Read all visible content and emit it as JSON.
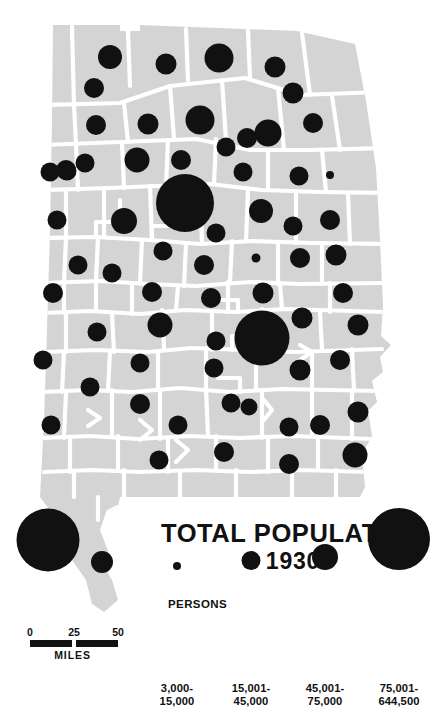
{
  "title": {
    "main": "TOTAL POPULATION",
    "year": "1930"
  },
  "legend": {
    "heading": "PERSONS",
    "classes": [
      {
        "line1": "3,000-",
        "line2": "15,000",
        "diameter": 8,
        "min": 3000,
        "max": 15000
      },
      {
        "line1": "15,001-",
        "line2": "45,000",
        "diameter": 19,
        "min": 15001,
        "max": 45000
      },
      {
        "line1": "45,001-",
        "line2": "75,000",
        "diameter": 26,
        "min": 45001,
        "max": 75000
      },
      {
        "line1": "75,001-",
        "line2": "644,500",
        "diameter": 62,
        "min": 75001,
        "max": 644500
      }
    ]
  },
  "scalebar": {
    "ticks": [
      "0",
      "25",
      "50"
    ],
    "units": "MILES"
  },
  "colors": {
    "county_fill": "#d4d4d4",
    "county_border": "#ffffff",
    "symbol": "#111111",
    "background": "#ffffff",
    "text": "#111111"
  },
  "chart_data": {
    "type": "scatter",
    "title": "TOTAL POPULATION 1930",
    "subtitle": "Alabama counties, proportional symbols",
    "xlabel": "",
    "ylabel": "",
    "legend_position": "bottom",
    "grid": false,
    "symbols": [
      {
        "x": 110,
        "y": 57,
        "d": 24
      },
      {
        "x": 166,
        "y": 64,
        "d": 21
      },
      {
        "x": 219,
        "y": 58,
        "d": 29
      },
      {
        "x": 275,
        "y": 67,
        "d": 21
      },
      {
        "x": 94,
        "y": 88,
        "d": 20
      },
      {
        "x": 96,
        "y": 125,
        "d": 20
      },
      {
        "x": 148,
        "y": 124,
        "d": 21
      },
      {
        "x": 200,
        "y": 120,
        "d": 29
      },
      {
        "x": 247,
        "y": 138,
        "d": 20
      },
      {
        "x": 293,
        "y": 93,
        "d": 21
      },
      {
        "x": 85,
        "y": 163,
        "d": 19
      },
      {
        "x": 138,
        "y": 160,
        "d": 20
      },
      {
        "x": 181,
        "y": 160,
        "d": 20
      },
      {
        "x": 268,
        "y": 133,
        "d": 27
      },
      {
        "x": 313,
        "y": 123,
        "d": 20
      },
      {
        "x": 226,
        "y": 147,
        "d": 19
      },
      {
        "x": 66,
        "y": 170,
        "d": 20
      },
      {
        "x": 185,
        "y": 203,
        "d": 58
      },
      {
        "x": 137,
        "y": 160,
        "d": 25
      },
      {
        "x": 243,
        "y": 172,
        "d": 19
      },
      {
        "x": 299,
        "y": 176,
        "d": 19
      },
      {
        "x": 330,
        "y": 175,
        "d": 8
      },
      {
        "x": 67,
        "y": 171,
        "d": 19
      },
      {
        "x": 50,
        "y": 172,
        "d": 19
      },
      {
        "x": 57,
        "y": 220,
        "d": 19
      },
      {
        "x": 124,
        "y": 221,
        "d": 26
      },
      {
        "x": 216,
        "y": 233,
        "d": 19
      },
      {
        "x": 261,
        "y": 211,
        "d": 24
      },
      {
        "x": 293,
        "y": 226,
        "d": 19
      },
      {
        "x": 330,
        "y": 220,
        "d": 20
      },
      {
        "x": 78,
        "y": 265,
        "d": 19
      },
      {
        "x": 112,
        "y": 273,
        "d": 19
      },
      {
        "x": 163,
        "y": 251,
        "d": 19
      },
      {
        "x": 204,
        "y": 265,
        "d": 20
      },
      {
        "x": 256,
        "y": 258,
        "d": 9
      },
      {
        "x": 300,
        "y": 258,
        "d": 20
      },
      {
        "x": 336,
        "y": 255,
        "d": 21
      },
      {
        "x": 53,
        "y": 293,
        "d": 20
      },
      {
        "x": 152,
        "y": 292,
        "d": 20
      },
      {
        "x": 211,
        "y": 298,
        "d": 20
      },
      {
        "x": 263,
        "y": 293,
        "d": 21
      },
      {
        "x": 343,
        "y": 293,
        "d": 20
      },
      {
        "x": 262,
        "y": 338,
        "d": 55
      },
      {
        "x": 216,
        "y": 341,
        "d": 19
      },
      {
        "x": 160,
        "y": 325,
        "d": 25
      },
      {
        "x": 97,
        "y": 332,
        "d": 19
      },
      {
        "x": 302,
        "y": 318,
        "d": 21
      },
      {
        "x": 358,
        "y": 325,
        "d": 21
      },
      {
        "x": 43,
        "y": 360,
        "d": 19
      },
      {
        "x": 140,
        "y": 363,
        "d": 19
      },
      {
        "x": 214,
        "y": 368,
        "d": 19
      },
      {
        "x": 300,
        "y": 370,
        "d": 21
      },
      {
        "x": 340,
        "y": 360,
        "d": 20
      },
      {
        "x": 90,
        "y": 387,
        "d": 19
      },
      {
        "x": 140,
        "y": 404,
        "d": 20
      },
      {
        "x": 178,
        "y": 425,
        "d": 19
      },
      {
        "x": 231,
        "y": 403,
        "d": 19
      },
      {
        "x": 249,
        "y": 407,
        "d": 17
      },
      {
        "x": 289,
        "y": 427,
        "d": 19
      },
      {
        "x": 320,
        "y": 425,
        "d": 20
      },
      {
        "x": 358,
        "y": 412,
        "d": 21
      },
      {
        "x": 51,
        "y": 425,
        "d": 19
      },
      {
        "x": 224,
        "y": 452,
        "d": 20
      },
      {
        "x": 159,
        "y": 460,
        "d": 19
      },
      {
        "x": 289,
        "y": 464,
        "d": 20
      },
      {
        "x": 355,
        "y": 455,
        "d": 25
      },
      {
        "x": 48,
        "y": 540,
        "d": 63
      },
      {
        "x": 102,
        "y": 562,
        "d": 22
      }
    ]
  }
}
